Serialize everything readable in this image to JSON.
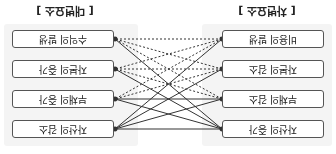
{
  "left": {
    "title": "[ 차변요소 ]",
    "items": [
      "자산의 증가",
      "부채의 감소",
      "자본의 감소",
      "비용의 발생"
    ]
  },
  "right": {
    "title": "[ 대변요소 ]",
    "items": [
      "자산의 감소",
      "부채의 증가",
      "자본의 증가",
      "수익의 발생"
    ]
  },
  "links": [
    {
      "from": 0,
      "to": 0,
      "style": "solid"
    },
    {
      "from": 0,
      "to": 1,
      "style": "solid"
    },
    {
      "from": 0,
      "to": 2,
      "style": "solid"
    },
    {
      "from": 0,
      "to": 3,
      "style": "solid"
    },
    {
      "from": 1,
      "to": 0,
      "style": "solid"
    },
    {
      "from": 1,
      "to": 1,
      "style": "solid"
    },
    {
      "from": 1,
      "to": 2,
      "style": "dashed"
    },
    {
      "from": 1,
      "to": 3,
      "style": "dashed"
    },
    {
      "from": 2,
      "to": 0,
      "style": "solid"
    },
    {
      "from": 2,
      "to": 1,
      "style": "dashed"
    },
    {
      "from": 2,
      "to": 2,
      "style": "dashed"
    },
    {
      "from": 2,
      "to": 3,
      "style": "dashed"
    },
    {
      "from": 3,
      "to": 0,
      "style": "solid"
    },
    {
      "from": 3,
      "to": 1,
      "style": "dashed"
    },
    {
      "from": 3,
      "to": 2,
      "style": "dashed"
    },
    {
      "from": 3,
      "to": 3,
      "style": "dashed"
    }
  ]
}
